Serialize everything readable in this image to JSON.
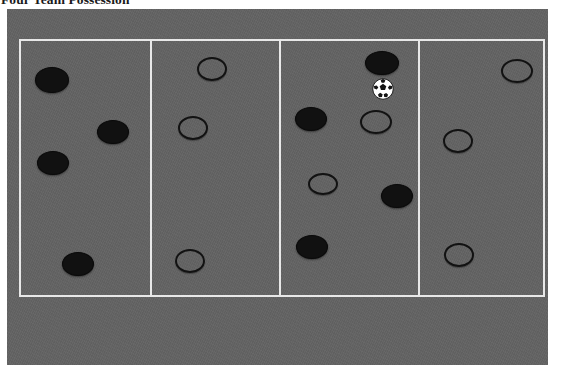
{
  "title": "Four Team Possession",
  "colors": {
    "field": "#636363",
    "line": "#e8e8e8",
    "dark_player": "#111111",
    "outline_player": "#121212",
    "ball_white": "#ffffff",
    "ball_black": "#141414",
    "background": "#ffffff"
  },
  "diagram": {
    "name": "four-team-possession-grid",
    "zone_count": 4,
    "zones": [
      {
        "index": 1,
        "label": "zone-1",
        "players": [
          {
            "type": "dark",
            "x": 52,
            "y": 80,
            "rx": 17,
            "ry": 13
          },
          {
            "type": "dark",
            "x": 113,
            "y": 132,
            "rx": 16,
            "ry": 12
          },
          {
            "type": "dark",
            "x": 53,
            "y": 163,
            "rx": 16,
            "ry": 12
          },
          {
            "type": "dark",
            "x": 78,
            "y": 264,
            "rx": 16,
            "ry": 12
          }
        ]
      },
      {
        "index": 2,
        "label": "zone-2",
        "players": [
          {
            "type": "outline",
            "x": 212,
            "y": 69,
            "rx": 15,
            "ry": 12
          },
          {
            "type": "outline",
            "x": 193,
            "y": 128,
            "rx": 15,
            "ry": 12
          },
          {
            "type": "outline",
            "x": 190,
            "y": 261,
            "rx": 15,
            "ry": 12
          }
        ]
      },
      {
        "index": 3,
        "label": "zone-3",
        "players": [
          {
            "type": "dark",
            "x": 382,
            "y": 63,
            "rx": 17,
            "ry": 12
          },
          {
            "type": "dark",
            "x": 311,
            "y": 119,
            "rx": 16,
            "ry": 12
          },
          {
            "type": "outline",
            "x": 376,
            "y": 122,
            "rx": 16,
            "ry": 12
          },
          {
            "type": "outline",
            "x": 323,
            "y": 184,
            "rx": 15,
            "ry": 11
          },
          {
            "type": "dark",
            "x": 397,
            "y": 196,
            "rx": 16,
            "ry": 12
          },
          {
            "type": "dark",
            "x": 312,
            "y": 247,
            "rx": 16,
            "ry": 12
          }
        ]
      },
      {
        "index": 4,
        "label": "zone-4",
        "players": [
          {
            "type": "outline",
            "x": 517,
            "y": 71,
            "rx": 16,
            "ry": 12
          },
          {
            "type": "outline",
            "x": 458,
            "y": 141,
            "rx": 15,
            "ry": 12
          },
          {
            "type": "outline",
            "x": 459,
            "y": 255,
            "rx": 15,
            "ry": 12
          }
        ]
      }
    ],
    "ball": {
      "name": "soccer-ball",
      "x": 383,
      "y": 89,
      "r": 11
    },
    "legend": {
      "dark_player": "filled-player-marker",
      "outline_player": "outlined-player-marker",
      "ball": "soccer-ball"
    }
  }
}
